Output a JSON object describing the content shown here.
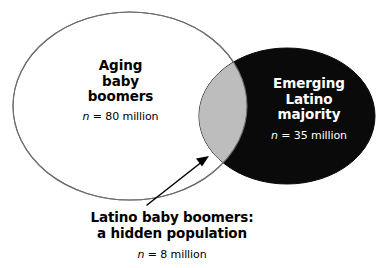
{
  "diagram": {
    "type": "venn",
    "title": "",
    "background_color": "#ffffff",
    "sets": [
      {
        "id": "aging-baby-boomers",
        "title_line_1": "Aging",
        "title_line_2": "baby",
        "title_line_3": "boomers",
        "n_symbol": "n",
        "n_value": "= 80 million",
        "fill_color": "#ffffff",
        "stroke_color": "#6e6e6e",
        "text_color": "#000000"
      },
      {
        "id": "emerging-latino-majority",
        "title_line_1": "Emerging",
        "title_line_2": "Latino",
        "title_line_3": "majority",
        "n_symbol": "n",
        "n_value": "= 35 million",
        "fill_color": "#0a0a0a",
        "stroke_color": "#0a0a0a",
        "text_color": "#ffffff"
      }
    ],
    "intersection": {
      "id": "latino-baby-boomers",
      "fill_color": "#bdbdbd",
      "caption_line_1": "Latino baby boomers:",
      "caption_line_2": "a hidden population",
      "n_symbol": "n",
      "n_value": "= 8 million"
    },
    "annotation": {
      "arrow_name": "intersection-callout-arrow",
      "arrow_color": "#000000"
    }
  }
}
